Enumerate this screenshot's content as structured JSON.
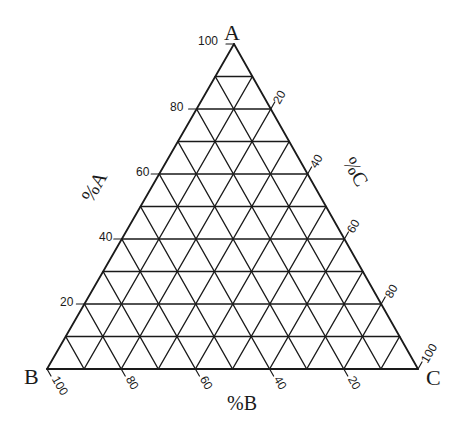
{
  "diagram": {
    "type": "ternary",
    "vertices": {
      "top": {
        "label": "A",
        "x": 234,
        "y": 44
      },
      "left": {
        "label": "B",
        "x": 47,
        "y": 369
      },
      "right": {
        "label": "C",
        "x": 418,
        "y": 369
      }
    },
    "grid_divisions": 10,
    "line_color": "#1a1a1a",
    "axes": {
      "a": {
        "title": "%A",
        "side": "left",
        "tick_labels": [
          "20",
          "40",
          "60",
          "80",
          "100"
        ]
      },
      "b": {
        "title": "%B",
        "side": "bottom",
        "tick_labels": [
          "100",
          "80",
          "60",
          "40",
          "20"
        ]
      },
      "c": {
        "title": "%C",
        "side": "right",
        "tick_labels": [
          "20",
          "40",
          "60",
          "80",
          "100"
        ]
      }
    }
  },
  "chart_data": {
    "type": "ternary",
    "title": "",
    "components": [
      "A",
      "B",
      "C"
    ],
    "axis_titles": {
      "A": "%A",
      "B": "%B",
      "C": "%C"
    },
    "grid": true,
    "grid_step_percent": 10,
    "tick_step_percent": 20,
    "axes": {
      "A": {
        "side": "left",
        "ticks": [
          20,
          40,
          60,
          80,
          100
        ],
        "range": [
          0,
          100
        ]
      },
      "B": {
        "side": "bottom",
        "ticks": [
          100,
          80,
          60,
          40,
          20
        ],
        "range": [
          0,
          100
        ]
      },
      "C": {
        "side": "right",
        "ticks": [
          20,
          40,
          60,
          80,
          100
        ],
        "range": [
          0,
          100
        ]
      }
    },
    "data_points": []
  }
}
